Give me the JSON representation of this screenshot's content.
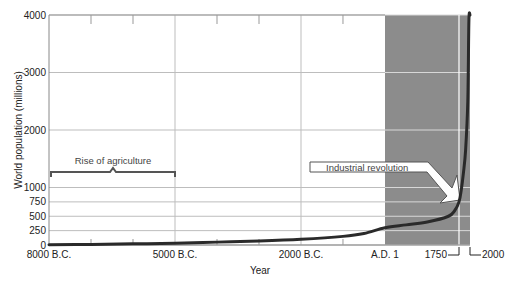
{
  "chart_data": {
    "type": "line",
    "title": "",
    "xlabel": "Year",
    "ylabel": "World population (millions)",
    "ylim": [
      0,
      4000
    ],
    "y_ticks": [
      0,
      250,
      500,
      750,
      1000,
      2000,
      3000,
      4000
    ],
    "x_ticks": [
      {
        "year": -8000,
        "label": "8000 B.C."
      },
      {
        "year": -5000,
        "label": "5000 B.C."
      },
      {
        "year": -2000,
        "label": "2000 B.C."
      },
      {
        "year": 1,
        "label": "A.D. 1"
      },
      {
        "year": 1750,
        "label": "1750"
      },
      {
        "year": 2000,
        "label": "2000"
      }
    ],
    "grid": true,
    "shaded_region": {
      "from": 1,
      "to": 2000,
      "color": "#8c8c8c"
    },
    "series": [
      {
        "name": "World population",
        "x": [
          -8000,
          -7000,
          -6000,
          -5000,
          -4000,
          -3000,
          -2000,
          -1000,
          -500,
          1,
          500,
          1000,
          1500,
          1650,
          1750,
          1800,
          1850,
          1900,
          1950,
          1975,
          2000
        ],
        "values": [
          5,
          10,
          20,
          30,
          50,
          70,
          100,
          150,
          200,
          300,
          350,
          400,
          500,
          600,
          750,
          950,
          1250,
          1650,
          2500,
          3900,
          4200
        ]
      }
    ],
    "annotations": [
      {
        "text": "Rise of agriculture",
        "type": "bracket",
        "from": -8000,
        "to": -5000
      },
      {
        "text": "Industrial revolution",
        "type": "arrow",
        "points_to_year": 1750
      }
    ]
  },
  "labels": {
    "ylabel": "World population (millions)",
    "xlabel": "Year",
    "agriculture": "Rise of agriculture",
    "industrial": "Industrial revolution"
  }
}
